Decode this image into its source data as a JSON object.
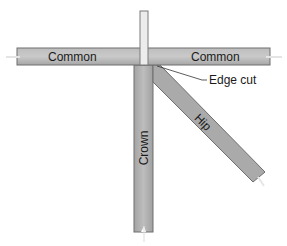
{
  "diagram": {
    "type": "roof-framing",
    "members": {
      "common_left": "Common",
      "common_right": "Common",
      "crown": "Crown",
      "hip": "Hip"
    },
    "callouts": {
      "edge_cut": "Edge cut"
    },
    "colors": {
      "member_fill": "#a8a8a8",
      "member_stroke": "#6e6e6e",
      "ridge_post_fill": "#e8e8e8",
      "background": "#ffffff",
      "text": "#1a1a1a"
    }
  }
}
